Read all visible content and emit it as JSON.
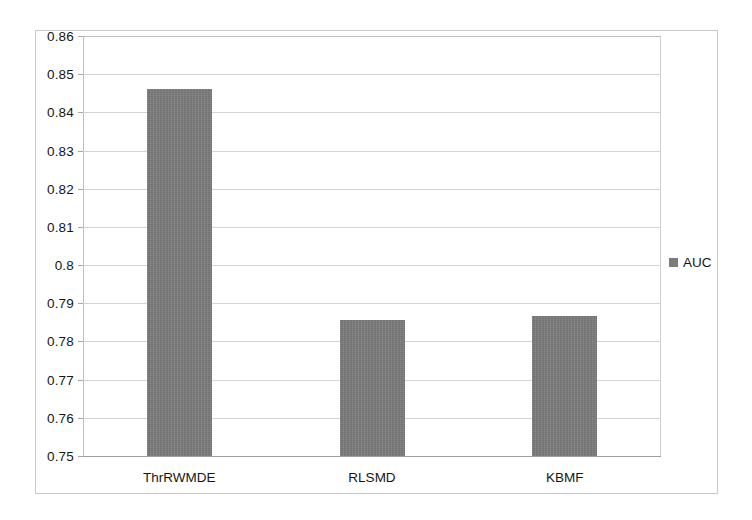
{
  "chart_data": {
    "type": "bar",
    "title": "",
    "xlabel": "",
    "ylabel": "",
    "categories": [
      "ThrRWMDE",
      "RLSMD",
      "KBMF"
    ],
    "values": [
      0.846,
      0.7857,
      0.7868
    ],
    "series": [
      {
        "name": "AUC",
        "values": [
          0.846,
          0.7857,
          0.7868
        ]
      }
    ],
    "ylim": [
      0.75,
      0.86
    ],
    "ytick_step": 0.01,
    "ytick_labels": [
      "0.86",
      "0.85",
      "0.84",
      "0.83",
      "0.82",
      "0.81",
      "0.8",
      "0.79",
      "0.78",
      "0.77",
      "0.76",
      "0.75"
    ],
    "ytick_values": [
      0.86,
      0.85,
      0.84,
      0.83,
      0.82,
      0.81,
      0.8,
      0.79,
      0.78,
      0.77,
      0.76,
      0.75
    ],
    "grid": true,
    "legend": {
      "position": "right",
      "entries": [
        "AUC"
      ]
    },
    "colors": {
      "bar": "#7c7c7c",
      "grid": "#d3d3d3",
      "frame": "#c9c9c9",
      "text": "#161616"
    }
  }
}
